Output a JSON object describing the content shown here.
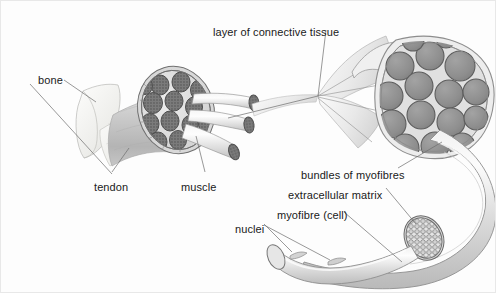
{
  "figure": {
    "background_color": "#fdfdfd",
    "border_color": "#e8e8e8",
    "ink_color": "#1a1a1a",
    "leader_line_color": "#6d6d6d",
    "palette": {
      "tendon_fill": "#f2f2f0",
      "muscle_body_fill": "#c9c9c9",
      "bundle_circle_fill": "#909090",
      "bundle_circle_stroke": "#555555",
      "sheath_fill": "#e3e3e3",
      "myofibre_fill": "#dcdcdc",
      "honeycomb_stroke": "#5a5a5a",
      "highlight": "#fafafa"
    }
  },
  "labels": [
    {
      "id": "bone",
      "text": "bone",
      "x": 38,
      "y": 74,
      "anchor": "left"
    },
    {
      "id": "layer-connective",
      "text": "layer of connective tissue",
      "x": 213,
      "y": 26,
      "anchor": "left"
    },
    {
      "id": "tendon",
      "text": "tendon",
      "x": 94,
      "y": 181,
      "anchor": "left"
    },
    {
      "id": "muscle",
      "text": "muscle",
      "x": 181,
      "y": 181,
      "anchor": "left"
    },
    {
      "id": "bundles-of-myofibres",
      "text": "bundles of myofibres",
      "x": 301,
      "y": 169,
      "anchor": "left"
    },
    {
      "id": "extracellular-matrix",
      "text": "extracellular matrix",
      "x": 288,
      "y": 189,
      "anchor": "left"
    },
    {
      "id": "myofibre-cell",
      "text": "myofibre (cell)",
      "x": 277,
      "y": 209,
      "anchor": "left"
    },
    {
      "id": "nuclei",
      "text": "nuclei",
      "x": 235,
      "y": 223,
      "anchor": "left"
    }
  ],
  "structures": {
    "bone": {
      "name": "bone",
      "description": "pale angular bone end at upper left"
    },
    "tendon": {
      "name": "tendon",
      "description": "pale band joining bone to muscle belly"
    },
    "muscle_belly": {
      "name": "muscle",
      "description": "grey conical muscle body with cut cross-section"
    },
    "muscle_cut_face": {
      "name": "muscle-cross-section",
      "bundle_count": 14,
      "description": "circular cut face showing packed speckled bundles inside connective sheath"
    },
    "protruding_bundles": {
      "name": "protruding-bundles",
      "count": 3,
      "description": "three bundles pulled out of the muscle cut face toward the right"
    },
    "magnified_bundle_cluster": {
      "name": "bundle-cluster-magnified",
      "circle_count": 16,
      "description": "enlarged view showing bundles of myofibres enclosed by connective tissue layer"
    },
    "connective_sheath": {
      "name": "connective-tissue-sheath",
      "description": "curved outer wrapping of the magnified bundle cluster"
    },
    "myofibre_tube": {
      "name": "myofibre-tube",
      "description": "long curved cylinder descending from the cluster to lower left"
    },
    "myofibre_cut_face": {
      "name": "myofibre-cross-section",
      "description": "honeycomb pattern of myofibrils on the cut end of the fibre"
    },
    "nuclei": {
      "name": "nuclei",
      "count": 2,
      "description": "small bulges on the surface of the myofibre cylinder"
    }
  },
  "leader_lines": [
    {
      "from": "bone",
      "to": "bone-surface"
    },
    {
      "from": "layer-connective",
      "to": "connective-sheath"
    },
    {
      "from": "tendon",
      "to": "tendon-band"
    },
    {
      "from": "muscle",
      "to": "muscle-cut-face"
    },
    {
      "from": "bundles-of-myofibres",
      "to": "bundle-cluster-magnified"
    },
    {
      "from": "extracellular-matrix",
      "to": "matrix-between-fibres"
    },
    {
      "from": "myofibre-cell",
      "to": "myofibre-tube"
    },
    {
      "from": "nuclei",
      "to": "nucleus-bulge-a"
    },
    {
      "from": "nuclei",
      "to": "nucleus-bulge-b"
    }
  ]
}
